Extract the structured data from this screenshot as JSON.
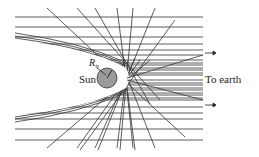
{
  "figure": {
    "labels": {
      "sun": "Sun",
      "radius_symbol": "R",
      "radius_subscript": "⊙",
      "destination": "To earth"
    },
    "colors": {
      "line": "#333333",
      "sun_fill": "#9a9a9a",
      "sun_stroke": "#333333",
      "background": "#ffffff"
    },
    "sun": {
      "cx": 107,
      "cy": 78,
      "r": 10
    },
    "horizontal_rays_y": [
      17,
      27,
      37,
      44,
      50,
      55,
      60,
      63,
      65,
      68,
      70,
      73,
      75,
      80,
      83,
      85,
      88,
      90,
      93,
      95,
      98,
      100,
      107,
      113,
      119,
      129,
      140
    ],
    "arrows": [
      {
        "x1": 205,
        "x2": 215,
        "y": 53
      },
      {
        "x1": 205,
        "x2": 215,
        "y": 105
      }
    ]
  }
}
